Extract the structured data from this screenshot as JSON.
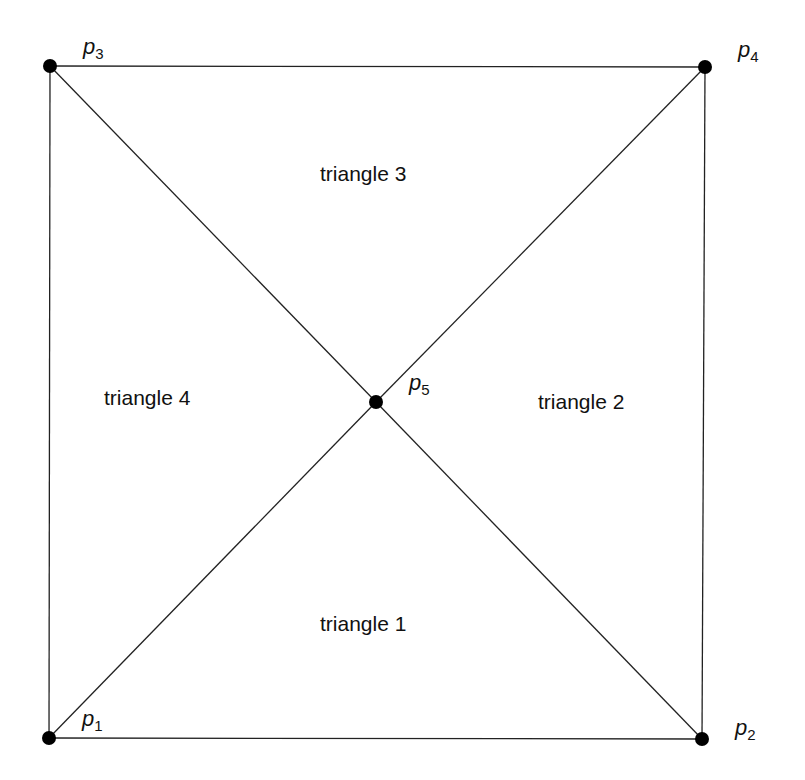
{
  "diagram": {
    "points": [
      {
        "id": "p1",
        "name": "p",
        "sub": "1",
        "x": 49,
        "y": 738,
        "label_x": 82,
        "label_y": 706
      },
      {
        "id": "p2",
        "name": "p",
        "sub": "2",
        "x": 702,
        "y": 739,
        "label_x": 735,
        "label_y": 715
      },
      {
        "id": "p3",
        "name": "p",
        "sub": "3",
        "x": 50,
        "y": 66,
        "label_x": 83,
        "label_y": 34
      },
      {
        "id": "p4",
        "name": "p",
        "sub": "4",
        "x": 705,
        "y": 67,
        "label_x": 738,
        "label_y": 37
      },
      {
        "id": "p5",
        "name": "p",
        "sub": "5",
        "x": 376,
        "y": 402,
        "label_x": 409,
        "label_y": 370
      }
    ],
    "edges": [
      [
        "p3",
        "p4"
      ],
      [
        "p4",
        "p2"
      ],
      [
        "p2",
        "p1"
      ],
      [
        "p1",
        "p3"
      ],
      [
        "p3",
        "p5"
      ],
      [
        "p5",
        "p2"
      ],
      [
        "p1",
        "p5"
      ],
      [
        "p5",
        "p4"
      ]
    ],
    "regions": [
      {
        "label": "triangle 1",
        "x": 320,
        "y": 612
      },
      {
        "label": "triangle 2",
        "x": 538,
        "y": 390
      },
      {
        "label": "triangle 3",
        "x": 320,
        "y": 162
      },
      {
        "label": "triangle 4",
        "x": 104,
        "y": 386
      }
    ],
    "colors": {
      "line": "#222222",
      "point": "#000000",
      "text": "#111111"
    }
  }
}
